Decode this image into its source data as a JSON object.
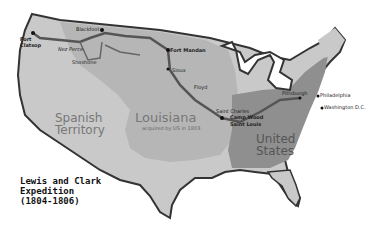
{
  "map": {
    "title_lines": [
      "Lewis and Clark",
      "Expedition",
      "(1804-1806)"
    ],
    "regions": {
      "spanish": [
        "Spanish",
        "Territory"
      ],
      "louisiana": "Louisiana",
      "louisiana_sub": "acquired by US in 1803",
      "us": [
        "United",
        "States"
      ]
    },
    "places": {
      "fort_clatsop": [
        "Fort",
        "Clatsop"
      ],
      "nez_perce": "Nez Perce",
      "shoshone": "Shoshone",
      "blackfoot": "Blackfoot",
      "fort_mandan": "Fort Mandan",
      "sioux": "Sioux",
      "floyd": "Floyd",
      "saint_charles": "Saint Charles",
      "camp_wood": "Camp Wood",
      "saint_louis": "Saint Louis",
      "pittsburgh": "Pittsburgh",
      "philadelphia": "Philadelphia",
      "washington": "Washington D.C."
    },
    "colors": {
      "spanish": "#c8c8c8",
      "louisiana": "#b4b4b4",
      "us": "#8c8c8c",
      "route": "#555555",
      "coast": "#333333"
    }
  }
}
